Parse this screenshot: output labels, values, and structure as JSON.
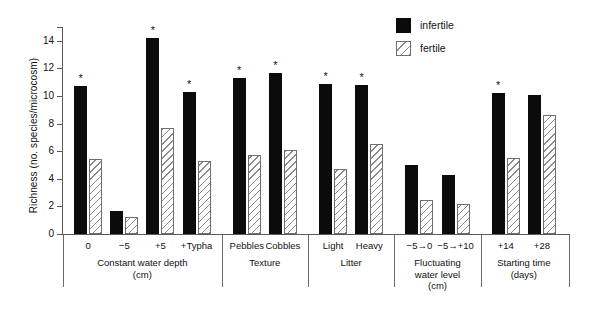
{
  "chart_data": {
    "type": "bar",
    "title": "",
    "xlabel": "",
    "ylabel": "Richness (no. species/microcosm)",
    "ylim": [
      0,
      15
    ],
    "yticks": [
      0,
      2,
      4,
      6,
      8,
      10,
      12,
      14
    ],
    "ytick_labels": [
      "0",
      "2",
      "4",
      "6",
      "8",
      "10",
      "12",
      "14"
    ],
    "grid": false,
    "legend_position": "top-right",
    "categories": [
      "0",
      "−5",
      "+5",
      "+Typha",
      "Pebbles",
      "Cobbles",
      "Light",
      "Heavy",
      "−5→0",
      "−5→+10",
      "+14",
      "+28"
    ],
    "series": [
      {
        "name": "infertile",
        "color": "#0b0b0b",
        "fill": "solid",
        "values": [
          10.7,
          1.7,
          14.2,
          10.3,
          11.3,
          11.7,
          10.9,
          10.8,
          5.0,
          4.3,
          10.2,
          10.1
        ]
      },
      {
        "name": "fertile",
        "color": "#8a8a8a",
        "fill": "diagonal-hatch",
        "values": [
          5.4,
          1.2,
          7.7,
          5.3,
          5.7,
          6.1,
          4.7,
          6.5,
          2.5,
          2.2,
          5.5,
          8.6
        ]
      }
    ],
    "significance_markers": {
      "symbol": "*",
      "categories": [
        "0",
        "+5",
        "+Typha",
        "Pebbles",
        "Cobbles",
        "Light",
        "Heavy",
        "+14"
      ]
    },
    "groups": [
      {
        "label": "Constant water depth",
        "unit": "(cm)",
        "categories": [
          "0",
          "−5",
          "+5",
          "+Typha"
        ]
      },
      {
        "label": "Texture",
        "unit": "",
        "categories": [
          "Pebbles",
          "Cobbles"
        ]
      },
      {
        "label": "Litter",
        "unit": "",
        "categories": [
          "Light",
          "Heavy"
        ]
      },
      {
        "label": "Fluctuating",
        "unit": "water level\n(cm)",
        "categories": [
          "−5→0",
          "−5→+10"
        ]
      },
      {
        "label": "Starting time",
        "unit": "(days)",
        "categories": [
          "+14",
          "+28"
        ]
      }
    ]
  },
  "legend": {
    "items": [
      {
        "label": "infertile",
        "swatch": "solid-black-square"
      },
      {
        "label": "fertile",
        "swatch": "hatched-square"
      }
    ]
  },
  "axis": {
    "ylabel": "Richness (no. species/microcosm)",
    "ytick_labels": [
      "14",
      "12",
      "10",
      "8",
      "6",
      "4",
      "2",
      "0"
    ]
  },
  "group_titles": [
    {
      "line1": "Constant water depth",
      "line2": "(cm)",
      "line3": ""
    },
    {
      "line1": "Texture",
      "line2": "",
      "line3": ""
    },
    {
      "line1": "Litter",
      "line2": "",
      "line3": ""
    },
    {
      "line1": "Fluctuating",
      "line2": "water level",
      "line3": "(cm)"
    },
    {
      "line1": "Starting time",
      "line2": "(days)",
      "line3": ""
    }
  ],
  "category_labels": [
    "0",
    "−5",
    "+5",
    "+Typha",
    "Pebbles",
    "Cobbles",
    "Light",
    "Heavy",
    "−5→0",
    "−5→+10",
    "+14",
    "+28"
  ]
}
